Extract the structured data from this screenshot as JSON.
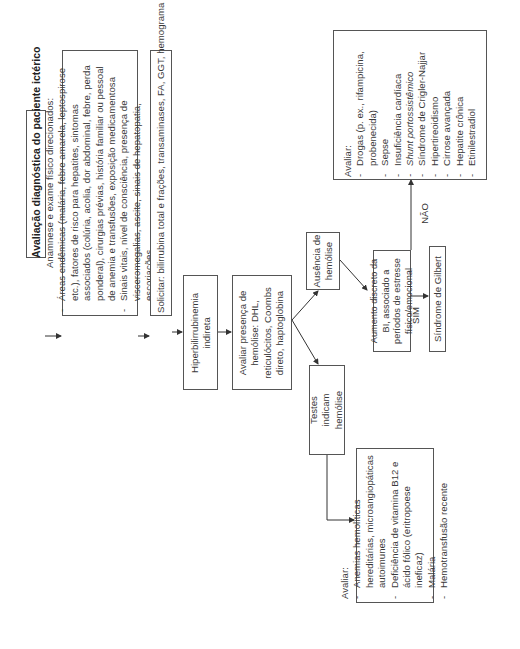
{
  "diagram": {
    "title": "Avaliação diagnóstica do paciente ictérico",
    "anamnese": {
      "heading": "Anamnese e exame físico direcionados:",
      "items": [
        "Áreas endêmicas (malária, febre amarela, leptospirose etc.), fatores de risco para hepatites, sintomas associados (colúria, acolia, dor abdominal, febre, perda ponderal), cirurgias prévias, história familiar ou pessoal de anemia e transfusões, exposição medicamentosa",
        "Sinais vitais, nível de consciência, presença de visceromegalias, ascite, sinais de hepatopatia, escoriações"
      ]
    },
    "solicitar": "Solicitar: bilirrubina total e frações, transaminases, FA, GGT, hemograma completo, albumina, INR",
    "hiperbilirrubinemia": "Hiperbilirrubinemia indireta",
    "avaliar_hemolise": "Avaliar presença de hemólise: DHL, reticulócitos, Coombs direto, haptoglobina",
    "ausencia_hemolise": "Ausência de hemólise",
    "testes_hemolise": "Testes indicam hemólise",
    "aumento_discreto": "Aumento discreto da BI, associado a períodos de estresse físico/emocional",
    "gilbert": "Síndrome de Gilbert",
    "edge_labels": {
      "sim": "SIM",
      "nao": "NÃO"
    },
    "avaliar_hemolise_causas": {
      "heading": "Avaliar:",
      "items": [
        "Anemias hemolíticas hereditárias, microangiopáticas autoimunes",
        "Deficiência de vitamina B12 e ácido fólico (eritropoese ineficaz)",
        "Malária",
        "Hemotransfusão recente"
      ]
    },
    "avaliar_outras_causas": {
      "heading": "Avaliar:",
      "items": [
        "Drogas (p. ex., rifampicina, probenecida)",
        "Sepse",
        "Insuficiência cardíaca",
        "Shunt portossistêmico",
        "Síndrome de Crigler-Najjar",
        "Hipertireoidismo",
        "Cirrose avançada",
        "Hepatite crônica",
        "Etinilestradiol"
      ]
    },
    "colors": {
      "border": "#555555",
      "text": "#3a3a3a",
      "background": "#ffffff"
    }
  }
}
